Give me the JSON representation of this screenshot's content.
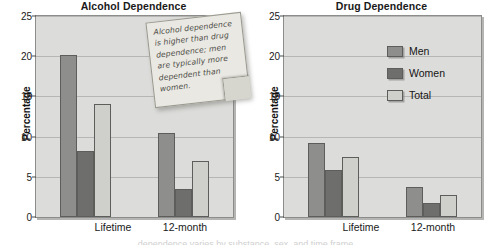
{
  "figure": {
    "caption_partial": "dependence varies by substance, sex, and time frame"
  },
  "note": {
    "name": "sticky-note",
    "text": "Alcohol dependence is higher than drug dependence; men are typically more dependent than women."
  },
  "legend": {
    "items": [
      {
        "label": "Men",
        "color": "#8e8e8c"
      },
      {
        "label": "Women",
        "color": "#6e6e6c"
      },
      {
        "label": "Total",
        "color": "#cfcfcc"
      }
    ]
  },
  "axis": {
    "ylabel": "Percentage",
    "ticks": [
      "0",
      "5",
      "10",
      "15",
      "20",
      "25"
    ],
    "categories": [
      "Lifetime",
      "12-month"
    ]
  },
  "chart_data": [
    {
      "type": "bar",
      "title": "Alcohol Dependence",
      "xlabel": "",
      "ylabel": "Percentage",
      "ylim": [
        0,
        25
      ],
      "yticks": [
        0,
        5,
        10,
        15,
        20,
        25
      ],
      "grid": true,
      "legend_position": "none",
      "categories": [
        "Lifetime",
        "12-month"
      ],
      "series": [
        {
          "name": "Men",
          "values": [
            20.1,
            10.5
          ]
        },
        {
          "name": "Women",
          "values": [
            8.2,
            3.5
          ]
        },
        {
          "name": "Total",
          "values": [
            14.1,
            7.0
          ]
        }
      ]
    },
    {
      "type": "bar",
      "title": "Drug Dependence",
      "xlabel": "",
      "ylabel": "Percentage",
      "ylim": [
        0,
        25
      ],
      "yticks": [
        0,
        5,
        10,
        15,
        20,
        25
      ],
      "grid": true,
      "legend_position": "upper right",
      "categories": [
        "Lifetime",
        "12-month"
      ],
      "series": [
        {
          "name": "Men",
          "values": [
            9.2,
            3.7
          ]
        },
        {
          "name": "Women",
          "values": [
            5.8,
            1.8
          ]
        },
        {
          "name": "Total",
          "values": [
            7.5,
            2.8
          ]
        }
      ]
    }
  ]
}
